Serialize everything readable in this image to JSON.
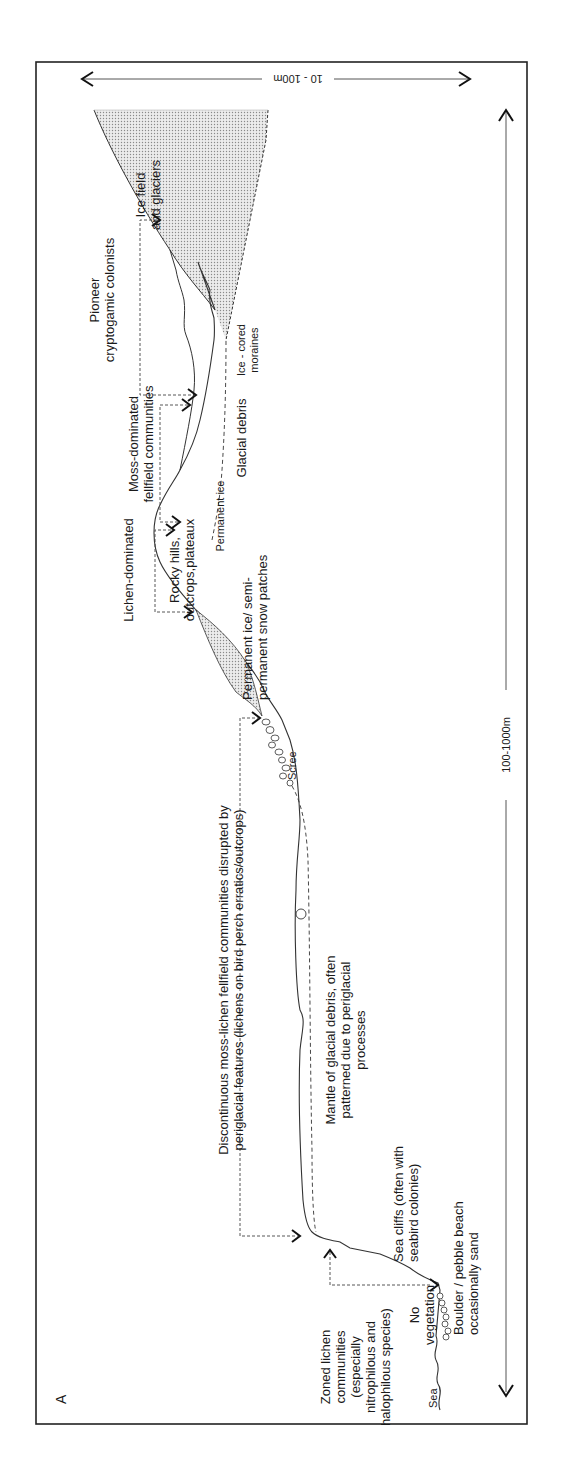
{
  "panel_label": "A",
  "scales": {
    "horizontal": "100-1000m",
    "vertical": "10 - 100m"
  },
  "zones": {
    "zoned_lichen": [
      "Zoned lichen",
      "communities",
      "(especially",
      "nitrophilous and",
      "halophilous species)"
    ],
    "no_vegetation": [
      "No",
      "vegetation"
    ],
    "discontinuous": [
      "Discontinuous moss-lichen fellfield communities disrupted by",
      "periglacial features (lichens on bird perch erratics/outcrops)"
    ],
    "lichen_dominated": [
      "Lichen-dominated"
    ],
    "moss_dominated": [
      "Moss-dominated",
      "fellfield communities"
    ],
    "pioneer": [
      "Pioneer",
      "cryptogamic colonists"
    ]
  },
  "features": {
    "sea": "Sea",
    "boulder_beach": [
      "Boulder / pebble beach",
      "occasionally sand"
    ],
    "sea_cliffs": [
      "Sea cliffs (often with",
      "seabird colonies)"
    ],
    "mantle": [
      "Mantle of glacial debris, often",
      "patterned due to periglacial",
      "processes"
    ],
    "scree": "Scree",
    "permanent_snow": [
      "Permanent ice/ semi-",
      "permanent snow patches"
    ],
    "rocky_hills": [
      "Rocky hills,",
      "outcrops,plateaux"
    ],
    "permanent_ice": "Permanent ice",
    "glacial_debris": "Glacial debris",
    "ice_cored": [
      "Ice - cored",
      "moraines"
    ],
    "ice_field": [
      "Ice field",
      "and glaciers"
    ]
  },
  "colors": {
    "line": "#333333",
    "stipple": "#c8c8c8",
    "frame": "#222222"
  }
}
